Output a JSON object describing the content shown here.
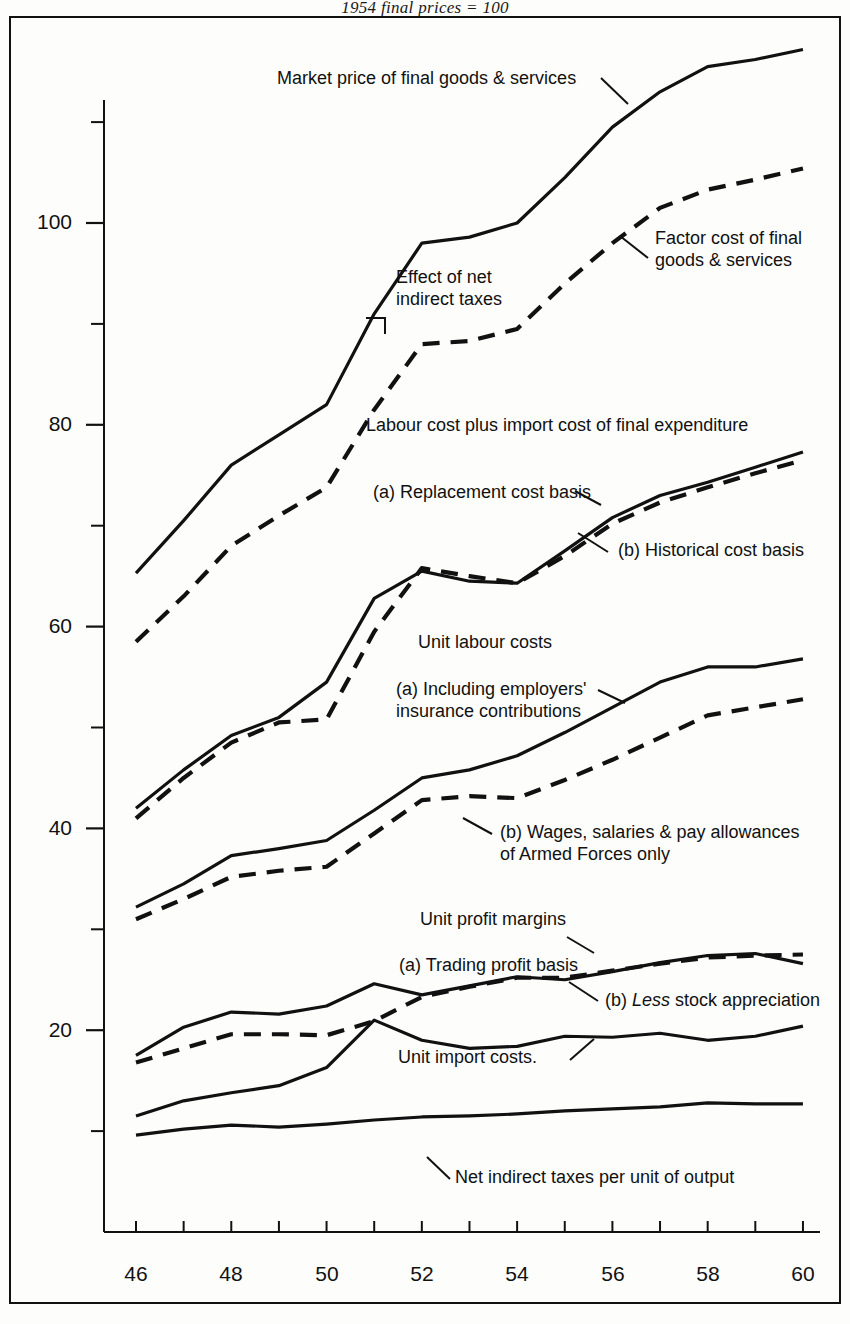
{
  "chart_data": {
    "type": "line",
    "title": "1954 final prices = 100",
    "xlabel": "",
    "ylabel": "",
    "xlim": [
      46,
      60
    ],
    "ylim": [
      8,
      120
    ],
    "x": [
      46,
      47,
      48,
      49,
      50,
      51,
      52,
      53,
      54,
      55,
      56,
      57,
      58,
      59,
      60
    ],
    "xtick_labels": [
      "46",
      "48",
      "50",
      "52",
      "54",
      "56",
      "58",
      "60"
    ],
    "xtick_values": [
      46,
      48,
      50,
      52,
      54,
      56,
      58,
      60
    ],
    "ytick_labels": [
      "100",
      "80",
      "60",
      "40",
      "20"
    ],
    "ytick_values": [
      100,
      80,
      60,
      40,
      20
    ],
    "yminor_values": [
      110,
      90,
      70,
      50,
      30,
      10
    ],
    "grid": false,
    "legend": "inline-annotations",
    "series": [
      {
        "name": "Market price of final goods & services",
        "style": "solid",
        "values": [
          65.3,
          70.5,
          76.0,
          79.0,
          82.0,
          91.0,
          98.0,
          98.6,
          100.0,
          104.5,
          109.5,
          113.0,
          115.5,
          116.2,
          117.2
        ]
      },
      {
        "name": "Factor cost of final goods & services",
        "style": "dashed",
        "values": [
          58.5,
          63.0,
          68.0,
          71.0,
          73.8,
          81.5,
          88.0,
          88.3,
          89.5,
          94.0,
          98.0,
          101.5,
          103.3,
          104.3,
          105.4
        ]
      },
      {
        "name": "Labour cost plus import cost of final expenditure (a) Replacement cost basis",
        "style": "solid",
        "values": [
          42.0,
          45.8,
          49.2,
          51.0,
          54.5,
          62.8,
          65.5,
          64.5,
          64.3,
          67.5,
          70.8,
          73.0,
          74.3,
          75.8,
          77.3
        ]
      },
      {
        "name": "Labour cost plus import cost of final expenditure (b) Historical cost basis",
        "style": "dashed",
        "values": [
          41.0,
          45.0,
          48.5,
          50.5,
          50.8,
          59.5,
          65.8,
          65.0,
          64.3,
          67.0,
          70.2,
          72.3,
          73.8,
          75.2,
          76.5
        ]
      },
      {
        "name": "Unit labour costs (a) Including employers' insurance contributions",
        "style": "solid",
        "values": [
          32.2,
          34.5,
          37.3,
          38.0,
          38.8,
          41.8,
          45.0,
          45.8,
          47.2,
          49.5,
          52.0,
          54.5,
          56.0,
          56.0,
          56.8
        ]
      },
      {
        "name": "Unit labour costs (b) Wages, salaries & pay allowances of Armed Forces only",
        "style": "dashed",
        "values": [
          31.0,
          33.0,
          35.2,
          35.8,
          36.2,
          39.5,
          42.8,
          43.2,
          43.0,
          44.8,
          46.8,
          49.0,
          51.2,
          52.0,
          52.8
        ]
      },
      {
        "name": "Unit profit margins (a) Trading profit basis",
        "style": "solid",
        "values": [
          17.5,
          20.3,
          21.8,
          21.6,
          22.4,
          24.6,
          23.5,
          24.4,
          25.3,
          25.0,
          25.8,
          26.7,
          27.4,
          27.6,
          26.6
        ]
      },
      {
        "name": "Unit profit margins (b) Less stock appreciation",
        "style": "dashed",
        "values": [
          16.8,
          18.2,
          19.6,
          19.6,
          19.5,
          20.9,
          23.3,
          24.3,
          25.2,
          25.2,
          25.9,
          26.6,
          27.2,
          27.4,
          27.5
        ]
      },
      {
        "name": "Unit import costs",
        "style": "solid",
        "values": [
          11.5,
          13.0,
          13.8,
          14.5,
          16.3,
          21.0,
          19.0,
          18.2,
          18.4,
          19.4,
          19.3,
          19.7,
          19.0,
          19.4,
          20.4
        ]
      },
      {
        "name": "Net indirect taxes per unit of output",
        "style": "solid",
        "values": [
          9.6,
          10.2,
          10.6,
          10.4,
          10.7,
          11.1,
          11.4,
          11.5,
          11.7,
          12.0,
          12.2,
          12.4,
          12.8,
          12.7,
          12.7
        ]
      }
    ],
    "annotations": [
      {
        "id": "market-price",
        "text": "Market price of final goods & services"
      },
      {
        "id": "factor-cost",
        "text": "Factor cost of final\ngoods & services"
      },
      {
        "id": "effect-net-taxes",
        "text": "Effect of net\nindirect taxes"
      },
      {
        "id": "labour-plus-import",
        "text": "Labour cost plus import cost of final expenditure"
      },
      {
        "id": "replacement-cost",
        "text": "(a) Replacement cost basis"
      },
      {
        "id": "historical-cost",
        "text": "(b) Historical cost basis"
      },
      {
        "id": "unit-labour-costs",
        "text": "Unit labour costs"
      },
      {
        "id": "including-employers",
        "text": "(a) Including employers'\ninsurance contributions"
      },
      {
        "id": "wages-salaries",
        "text": "(b) Wages, salaries & pay allowances\nof Armed Forces only"
      },
      {
        "id": "unit-profit-margins",
        "text": "Unit profit margins"
      },
      {
        "id": "trading-profit",
        "text": "(a) Trading profit basis"
      },
      {
        "id": "less-stock",
        "text": "(b) Less stock appreciation"
      },
      {
        "id": "unit-import-costs",
        "text": "Unit import costs."
      },
      {
        "id": "net-indirect-taxes",
        "text": "Net indirect taxes per unit of output"
      }
    ]
  },
  "annotations": {
    "market_price": "Market price of final goods & services",
    "factor_cost_line1": "Factor cost of final",
    "factor_cost_line2": "goods & services",
    "effect_taxes_line1": "Effect of net",
    "effect_taxes_line2": "indirect taxes",
    "labour_plus_import": "Labour cost plus import cost of final expenditure",
    "replacement_cost": "(a) Replacement cost basis",
    "historical_cost": "(b) Historical cost basis",
    "unit_labour_costs": "Unit labour costs",
    "including_employers_line1": "(a) Including employers'",
    "including_employers_line2": "insurance contributions",
    "wages_salaries_line1": "(b) Wages, salaries & pay allowances",
    "wages_salaries_line2": "of Armed Forces only",
    "unit_profit_margins": "Unit profit margins",
    "trading_profit": "(a) Trading profit basis",
    "less_stock_prefix": "(b) ",
    "less_stock_ital": "Less",
    "less_stock_suffix": " stock appreciation",
    "unit_import_costs": "Unit import costs.",
    "net_indirect_taxes": "Net indirect taxes per unit of output"
  },
  "colors": {
    "ink": "#111111",
    "paper": "#fdfdfb"
  }
}
